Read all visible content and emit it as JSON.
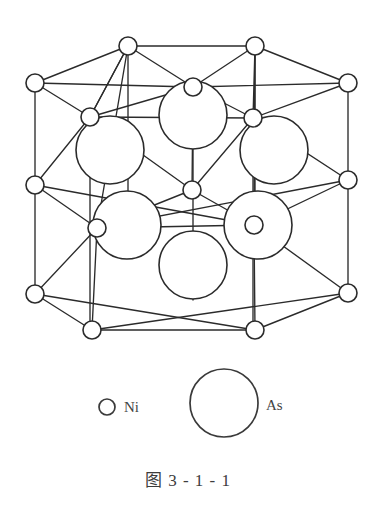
{
  "figure": {
    "caption": "图 3 - 1 - 1",
    "stroke_color": "#2b2b2b",
    "background_color": "#ffffff"
  },
  "legend": {
    "items": [
      {
        "symbol": "Ni",
        "shape": "small-circle",
        "radius": 8
      },
      {
        "symbol": "As",
        "shape": "large-circle",
        "radius": 34
      }
    ]
  },
  "structure_data": {
    "type": "ball-and-stick-crystal-lattice",
    "ni_radius": 9,
    "as_radius": 34,
    "ni_atoms": [
      {
        "id": "n_top_l",
        "x": 128,
        "y": 46
      },
      {
        "id": "n_top_r",
        "x": 255,
        "y": 46
      },
      {
        "id": "n_ul",
        "x": 35,
        "y": 83
      },
      {
        "id": "n_ur",
        "x": 348,
        "y": 83
      },
      {
        "id": "n_ml",
        "x": 35,
        "y": 185
      },
      {
        "id": "n_mr",
        "x": 348,
        "y": 180
      },
      {
        "id": "n_ll",
        "x": 35,
        "y": 294
      },
      {
        "id": "n_lr",
        "x": 348,
        "y": 293
      },
      {
        "id": "n_bot_l",
        "x": 92,
        "y": 330
      },
      {
        "id": "n_bot_r",
        "x": 255,
        "y": 330
      },
      {
        "id": "n_in_ul",
        "x": 90,
        "y": 117
      },
      {
        "id": "n_in_uc",
        "x": 193,
        "y": 87
      },
      {
        "id": "n_in_ur",
        "x": 253,
        "y": 118
      },
      {
        "id": "n_center",
        "x": 192,
        "y": 190
      },
      {
        "id": "n_in_ll",
        "x": 97,
        "y": 228
      },
      {
        "id": "n_in_lr",
        "x": 254,
        "y": 225
      }
    ],
    "as_atoms": [
      {
        "id": "a_up_l",
        "x": 110,
        "y": 150
      },
      {
        "id": "a_up_c",
        "x": 193,
        "y": 115
      },
      {
        "id": "a_up_r",
        "x": 274,
        "y": 150
      },
      {
        "id": "a_lo_l",
        "x": 127,
        "y": 225
      },
      {
        "id": "a_lo_c",
        "x": 193,
        "y": 265
      },
      {
        "id": "a_lo_r",
        "x": 258,
        "y": 225
      }
    ],
    "bonds": [
      [
        "n_top_l",
        "n_top_r"
      ],
      [
        "n_top_l",
        "n_ul"
      ],
      [
        "n_top_r",
        "n_ur"
      ],
      [
        "n_top_l",
        "n_in_uc"
      ],
      [
        "n_top_r",
        "n_in_uc"
      ],
      [
        "n_top_l",
        "n_in_ul"
      ],
      [
        "n_top_r",
        "n_in_ur"
      ],
      [
        "n_ul",
        "n_ml"
      ],
      [
        "n_ml",
        "n_ll"
      ],
      [
        "n_ur",
        "n_mr"
      ],
      [
        "n_mr",
        "n_lr"
      ],
      [
        "n_ul",
        "n_in_ul"
      ],
      [
        "n_ul",
        "n_in_uc"
      ],
      [
        "n_ur",
        "n_in_ur"
      ],
      [
        "n_ur",
        "n_in_uc"
      ],
      [
        "n_in_ul",
        "n_in_uc"
      ],
      [
        "n_in_uc",
        "n_in_ur"
      ],
      [
        "n_in_ul",
        "n_in_ur"
      ],
      [
        "n_in_ul",
        "n_ml"
      ],
      [
        "n_in_ur",
        "n_mr"
      ],
      [
        "n_in_uc",
        "n_center"
      ],
      [
        "n_in_ul",
        "n_center"
      ],
      [
        "n_in_ur",
        "n_center"
      ],
      [
        "n_center",
        "n_in_ll"
      ],
      [
        "n_center",
        "n_in_lr"
      ],
      [
        "n_in_ll",
        "n_in_lr"
      ],
      [
        "n_ml",
        "n_in_ll"
      ],
      [
        "n_mr",
        "n_in_lr"
      ],
      [
        "n_ml",
        "n_in_lr"
      ],
      [
        "n_mr",
        "n_in_ll"
      ],
      [
        "n_in_ll",
        "n_ll"
      ],
      [
        "n_in_lr",
        "n_lr"
      ],
      [
        "n_in_ll",
        "n_bot_l"
      ],
      [
        "n_in_lr",
        "n_bot_r"
      ],
      [
        "n_ll",
        "n_bot_l"
      ],
      [
        "n_lr",
        "n_bot_r"
      ],
      [
        "n_ll",
        "n_bot_r"
      ],
      [
        "n_lr",
        "n_bot_l"
      ],
      [
        "n_bot_l",
        "n_bot_r"
      ],
      [
        "n_in_ul",
        "n_top_l"
      ],
      [
        "n_top_l",
        "n_in_ll"
      ],
      [
        "n_top_r",
        "n_in_lr"
      ]
    ],
    "vertical_edges": [
      [
        "n_top_l",
        46,
        258
      ],
      [
        "n_top_r",
        46,
        258
      ],
      [
        "n_in_ul",
        117,
        330
      ],
      [
        "n_in_ur",
        118,
        330
      ],
      [
        "n_in_uc",
        87,
        300
      ]
    ]
  }
}
